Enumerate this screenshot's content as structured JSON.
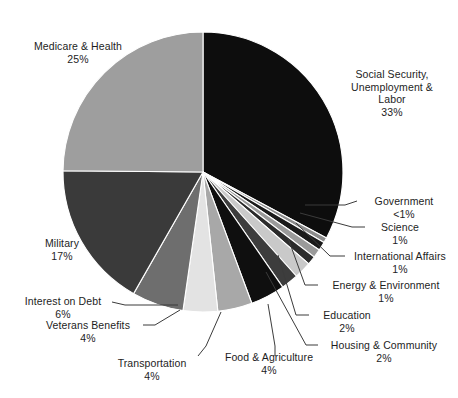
{
  "chart_data": {
    "type": "pie",
    "title": "",
    "subtitle": "",
    "xlabel": "",
    "ylabel": "",
    "legend_position": "outside-labels",
    "grid": false,
    "start_angle_deg": 0,
    "direction": "clockwise",
    "units": "percent of total spending",
    "categories": [
      "Social Security, Unemployment & Labor",
      "Government",
      "Science",
      "International Affairs",
      "Energy & Environment",
      "Education",
      "Housing & Community",
      "Food & Agriculture",
      "Transportation",
      "Veterans Benefits",
      "Interest on Debt",
      "Military",
      "Medicare & Health"
    ],
    "values": [
      33,
      0.6,
      1,
      1,
      1,
      2,
      2,
      4,
      4,
      4,
      6,
      17,
      25
    ],
    "value_labels": [
      "33%",
      "<1%",
      "1%",
      "1%",
      "1%",
      "2%",
      "2%",
      "4%",
      "4%",
      "4%",
      "6%",
      "17%",
      "25%"
    ],
    "colors": [
      "#0d0d0d",
      "#8c8c8c",
      "#1a1a1a",
      "#9a9a9a",
      "#2b2b2b",
      "#c9c9c9",
      "#3d3d3d",
      "#0f0f0f",
      "#a8a8a8",
      "#e3e3e3",
      "#6e6e6e",
      "#3a3a3a",
      "#9e9e9e"
    ],
    "background": "#ffffff",
    "outline": "#ffffff"
  },
  "slices": [
    {
      "name": "social-security",
      "label": "Social Security,\nUnemployment &\nLabor",
      "line1": "Social Security,",
      "line2": "Unemployment &",
      "line3": "Labor",
      "pct": "33%",
      "value": 33,
      "color": "#0d0d0d"
    },
    {
      "name": "government",
      "line1": "Government",
      "pct": "<1%",
      "value": 0.6,
      "color": "#8c8c8c"
    },
    {
      "name": "science",
      "line1": "Science",
      "pct": "1%",
      "value": 1,
      "color": "#1a1a1a"
    },
    {
      "name": "international-affairs",
      "line1": "International Affairs",
      "pct": "1%",
      "value": 1,
      "color": "#9a9a9a"
    },
    {
      "name": "energy-environment",
      "line1": "Energy & Environment",
      "pct": "1%",
      "value": 1,
      "color": "#2b2b2b"
    },
    {
      "name": "education",
      "line1": "Education",
      "pct": "2%",
      "value": 2,
      "color": "#c9c9c9"
    },
    {
      "name": "housing-community",
      "line1": "Housing & Community",
      "pct": "2%",
      "value": 2,
      "color": "#3d3d3d"
    },
    {
      "name": "food-agriculture",
      "line1": "Food & Agriculture",
      "pct": "4%",
      "value": 4,
      "color": "#0f0f0f"
    },
    {
      "name": "transportation",
      "line1": "Transportation",
      "pct": "4%",
      "value": 4,
      "color": "#a8a8a8"
    },
    {
      "name": "veterans-benefits",
      "line1": "Veterans Benefits",
      "pct": "4%",
      "value": 4,
      "color": "#e3e3e3"
    },
    {
      "name": "interest-on-debt",
      "line1": "Interest on Debt",
      "pct": "6%",
      "value": 6,
      "color": "#6e6e6e"
    },
    {
      "name": "military",
      "line1": "Military",
      "pct": "17%",
      "value": 17,
      "color": "#3a3a3a"
    },
    {
      "name": "medicare-health",
      "line1": "Medicare & Health",
      "pct": "25%",
      "value": 25,
      "color": "#9e9e9e"
    }
  ]
}
